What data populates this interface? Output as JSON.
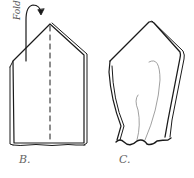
{
  "figure": {
    "panels": [
      {
        "id": "B",
        "label": "B.",
        "annotation": "Fold",
        "description": "flat pentagonal piece with dashed center fold line and curved fold arrow"
      },
      {
        "id": "C",
        "label": "C.",
        "description": "folded piece with tapered shape, inner curved seam lines, and wavy bottom edge"
      }
    ],
    "colors": {
      "stroke": "#1a1a1a",
      "thin_stroke": "#888888",
      "label": "#666666",
      "background": "#ffffff"
    }
  }
}
